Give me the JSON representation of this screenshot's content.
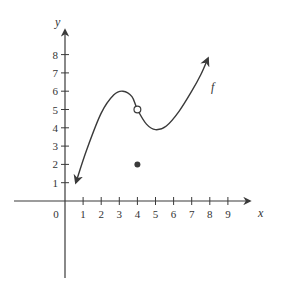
{
  "chart_data": {
    "type": "line",
    "title": "",
    "xlabel": "x",
    "ylabel": "y",
    "origin_label": "0",
    "xlim": [
      -2.8,
      10
    ],
    "ylim": [
      -5,
      10
    ],
    "x_ticks": [
      1,
      2,
      3,
      4,
      5,
      6,
      7,
      8,
      9
    ],
    "y_ticks": [
      1,
      2,
      3,
      4,
      5,
      6,
      7,
      8
    ],
    "grid": false,
    "series": [
      {
        "name": "f",
        "label": "f",
        "points": [
          [
            0.6,
            1.0
          ],
          [
            1.2,
            2.8
          ],
          [
            2.0,
            4.8
          ],
          [
            2.7,
            5.8
          ],
          [
            3.2,
            6.0
          ],
          [
            3.7,
            5.7
          ],
          [
            4.0,
            5.0
          ],
          [
            4.5,
            4.2
          ],
          [
            5.0,
            3.9
          ],
          [
            5.6,
            4.1
          ],
          [
            6.3,
            4.9
          ],
          [
            7.0,
            6.0
          ],
          [
            7.5,
            6.9
          ],
          [
            7.9,
            7.8
          ]
        ],
        "arrow_start": true,
        "arrow_end": true
      }
    ],
    "open_points": [
      [
        4,
        5
      ]
    ],
    "filled_points": [
      [
        4,
        2
      ]
    ],
    "colors": {
      "ink": "#3a3a3a"
    }
  }
}
